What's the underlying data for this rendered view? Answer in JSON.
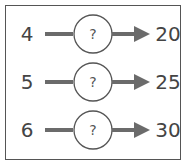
{
  "diagram": {
    "rows": [
      {
        "input": "4",
        "operation": "?",
        "output": "20"
      },
      {
        "input": "5",
        "operation": "?",
        "output": "25"
      },
      {
        "input": "6",
        "operation": "?",
        "output": "30"
      }
    ],
    "colors": {
      "line": "#6b6b6b",
      "circle_stroke": "#555555",
      "border": "#555555",
      "text": "#444444"
    }
  }
}
